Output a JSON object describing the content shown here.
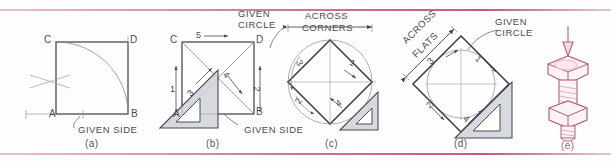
{
  "figure": {
    "ink_color": "#4a4a55",
    "accent_color": "#b5607f",
    "setsquare_fill": "#cfd2d8"
  },
  "panels": [
    {
      "id": "a",
      "caption": "(a)",
      "labels": [
        "GIVEN SIDE"
      ],
      "points": [
        "A",
        "B",
        "C",
        "D"
      ],
      "numbers": []
    },
    {
      "id": "b",
      "caption": "(b)",
      "labels": [
        "GIVEN SIDE"
      ],
      "points": [
        "A",
        "B",
        "C",
        "D"
      ],
      "numbers": [
        "1",
        "2",
        "3",
        "4",
        "5"
      ]
    },
    {
      "id": "c",
      "caption": "(c)",
      "labels": [
        "GIVEN CIRCLE",
        "ACROSS",
        "CORNERS"
      ],
      "points": [],
      "numbers": [
        "1",
        "2",
        "3",
        "4"
      ]
    },
    {
      "id": "d",
      "caption": "(d)",
      "labels": [
        "GIVEN CIRCLE",
        "ACROSS",
        "FLATS"
      ],
      "points": [],
      "numbers": [
        "1",
        "2",
        "3",
        "4"
      ]
    },
    {
      "id": "e",
      "caption": "(e)",
      "labels": [],
      "points": [],
      "numbers": []
    }
  ],
  "panel_a": {
    "caption": "(a)",
    "pt_a": "A",
    "pt_b": "B",
    "pt_c": "C",
    "pt_d": "D",
    "given_side": "GIVEN SIDE"
  },
  "panel_b": {
    "caption": "(b)",
    "pt_a": "A",
    "pt_b": "B",
    "pt_c": "C",
    "pt_d": "D",
    "given_side": "GIVEN SIDE",
    "n1": "1",
    "n2": "2",
    "n3": "3",
    "n4": "4",
    "n5": "5"
  },
  "panel_c": {
    "caption": "(c)",
    "given_circle_line1": "GIVEN",
    "given_circle_line2": "CIRCLE",
    "dim_line1": "ACROSS",
    "dim_line2": "CORNERS",
    "n1": "1",
    "n2": "2",
    "n3": "3",
    "n4": "4"
  },
  "panel_d": {
    "caption": "(d)",
    "given_circle_line1": "GIVEN",
    "given_circle_line2": "CIRCLE",
    "dim_line1": "ACROSS",
    "dim_line2": "FLATS",
    "n1": "1",
    "n2": "2",
    "n3": "3",
    "n4": "4"
  },
  "panel_e": {
    "caption": "(e)"
  }
}
